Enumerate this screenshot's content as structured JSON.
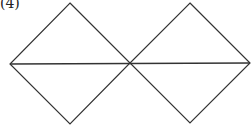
{
  "figure": {
    "label": "(4)",
    "stroke_color": "#333333",
    "stroke_width": 1.2,
    "shapes": [
      {
        "name": "left-diamond",
        "points": [
          [
            70,
            3
          ],
          [
            130,
            63
          ],
          [
            70,
            124
          ],
          [
            10,
            64
          ]
        ]
      },
      {
        "name": "right-diamond",
        "points": [
          [
            190,
            3
          ],
          [
            250,
            63
          ],
          [
            190,
            123
          ],
          [
            130,
            63
          ]
        ]
      }
    ],
    "lines": [
      {
        "name": "horizontal-diagonal",
        "from": [
          10,
          64
        ],
        "to": [
          250,
          63
        ]
      }
    ]
  }
}
